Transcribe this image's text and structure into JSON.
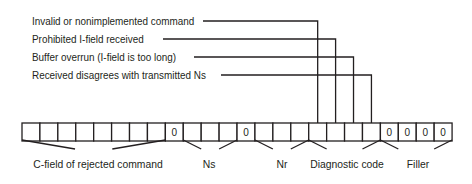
{
  "diagram": {
    "type": "frame-format",
    "stroke_color": "#231f20",
    "callouts": [
      {
        "label": "Invalid or nonimplemented command",
        "y": 21,
        "target_cell": 17
      },
      {
        "label": "Prohibited I-field received",
        "y": 39,
        "target_cell": 18
      },
      {
        "label": "Buffer overrun (I-field is too long)",
        "y": 57,
        "target_cell": 19
      },
      {
        "label": "Received disagrees with transmitted Ns",
        "y": 75,
        "target_cell": 20
      }
    ],
    "cells": [
      "",
      "",
      "",
      "",
      "",
      "",
      "",
      "",
      "0",
      "",
      "",
      "",
      "0",
      "",
      "",
      "",
      "",
      "",
      "",
      "",
      "0",
      "0",
      "0",
      "0"
    ],
    "groups": [
      {
        "label": "C-field of rejected command",
        "start_cell": 1,
        "end_cell": 8
      },
      {
        "label": "Ns",
        "start_cell": 10,
        "end_cell": 12
      },
      {
        "label": "Nr",
        "start_cell": 14,
        "end_cell": 16
      },
      {
        "label": "Diagnostic code",
        "start_cell": 17,
        "end_cell": 20
      },
      {
        "label": "Filler",
        "start_cell": 21,
        "end_cell": 24
      }
    ]
  }
}
